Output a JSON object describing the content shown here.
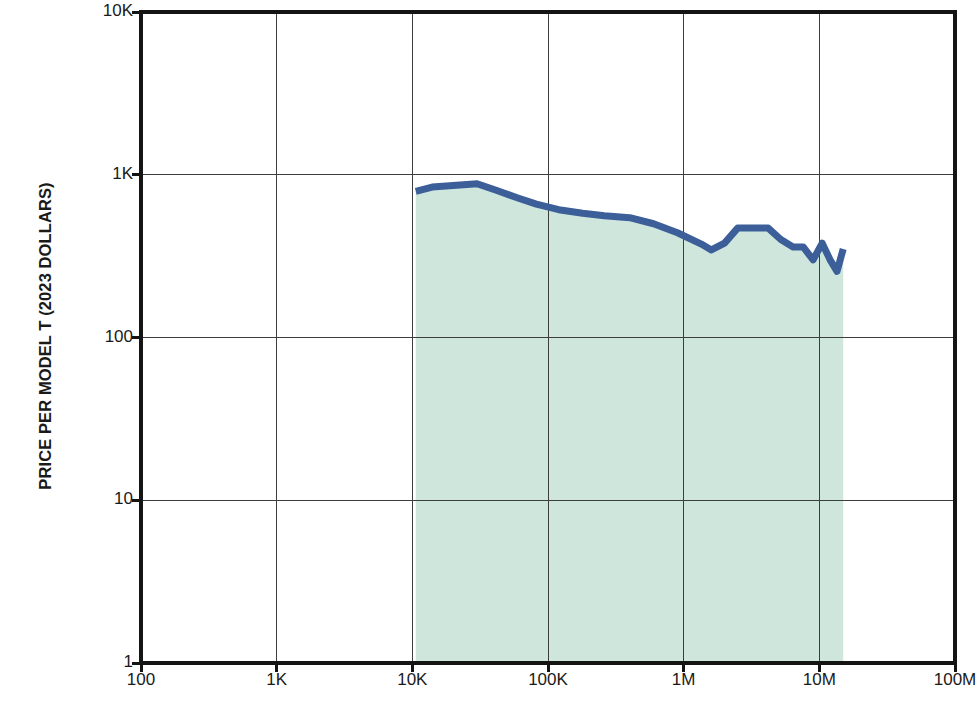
{
  "chart_data": {
    "type": "line",
    "title": "",
    "subtitle": "",
    "xlabel": "CUMULATIVE PRODUCTION",
    "ylabel": "PRICE PER MODEL T (2023 DOLLARS)",
    "xscale": "log",
    "yscale": "log",
    "xlim": [
      100,
      100000000
    ],
    "ylim": [
      1,
      10000
    ],
    "grid": true,
    "legend": null,
    "legend_position": "none",
    "xticks": [
      100,
      1000,
      10000,
      100000,
      1000000,
      10000000,
      100000000
    ],
    "xtick_labels": [
      "100",
      "1K",
      "10K",
      "100K",
      "1M",
      "10M",
      "100M"
    ],
    "yticks": [
      1,
      10,
      100,
      1000,
      10000
    ],
    "ytick_labels": [
      "1",
      "10",
      "100",
      "1K",
      "10K"
    ],
    "series": [
      {
        "name": "Price per Model T",
        "color": "#3c5f99",
        "fill_color": "#cfe6dc",
        "fill_to": 1,
        "x": [
          10600,
          14000,
          20000,
          30000,
          42000,
          60000,
          82000,
          120000,
          180000,
          260000,
          400000,
          600000,
          900000,
          1350000,
          1600000,
          2000000,
          2500000,
          3200000,
          4200000,
          5200000,
          6400000,
          7600000,
          9000000,
          10500000,
          12000000,
          13500000,
          15000000
        ],
        "y": [
          790,
          840,
          860,
          880,
          800,
          720,
          660,
          610,
          580,
          560,
          545,
          500,
          440,
          375,
          345,
          380,
          470,
          470,
          470,
          400,
          360,
          360,
          300,
          380,
          300,
          255,
          350
        ]
      }
    ]
  },
  "ghost_text": {
    "lines": [
      "and more and more and the world",
      "of the production line that was",
      "machines were being built, and",
      "which late in the first production run",
      "",
      "remained overnight. While a few",
      "but interior work: there was not",
      "and smaller machines and by no",
      "was not"
    ]
  }
}
